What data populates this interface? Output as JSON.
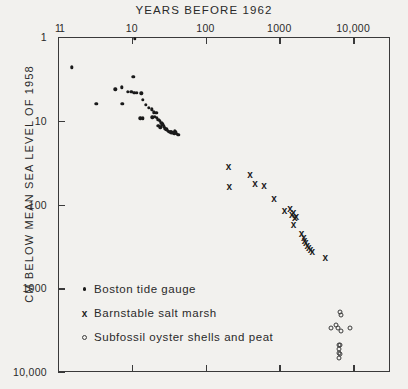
{
  "chart_data": {
    "type": "scatter",
    "title": "YEARS BEFORE 1962",
    "xlabel": "YEARS BEFORE 1962",
    "ylabel": "CM BELOW MEAN SEA LEVEL OF 1958",
    "xscale": "log",
    "yscale": "log",
    "xlim": [
      1,
      31623
    ],
    "ylim": [
      1,
      10000
    ],
    "y_inverted": true,
    "grid": false,
    "legend_position": "lower-left-inside",
    "xticks": [
      {
        "value": 1,
        "label": "1"
      },
      {
        "value": 10,
        "label": "10"
      },
      {
        "value": 100,
        "label": "100"
      },
      {
        "value": 1000,
        "label": "1000"
      },
      {
        "value": 10000,
        "label": "10,000"
      }
    ],
    "yticks": [
      {
        "value": 1,
        "label": "1"
      },
      {
        "value": 10,
        "label": "10"
      },
      {
        "value": 100,
        "label": "100"
      },
      {
        "value": 1000,
        "label": "1000"
      },
      {
        "value": 10000,
        "label": "10,000"
      }
    ],
    "series": [
      {
        "name": "Boston tide gauge",
        "marker": "dot",
        "points": [
          [
            1.55,
            2.3
          ],
          [
            11.0,
            1.05
          ],
          [
            10.5,
            3.0
          ],
          [
            3.3,
            6.3
          ],
          [
            7.4,
            6.3
          ],
          [
            6.0,
            4.2
          ],
          [
            7.3,
            4.0
          ],
          [
            8.8,
            4.5
          ],
          [
            9.8,
            4.5
          ],
          [
            10.8,
            4.6
          ],
          [
            11.6,
            4.6
          ],
          [
            13.5,
            4.7
          ],
          [
            14.0,
            5.6
          ],
          [
            15.5,
            6.4
          ],
          [
            17.0,
            7.0
          ],
          [
            18.6,
            7.3
          ],
          [
            20.0,
            7.9
          ],
          [
            21.5,
            8.1
          ],
          [
            13.0,
            9.3
          ],
          [
            14.2,
            9.3
          ],
          [
            19.0,
            9.1
          ],
          [
            20.5,
            9.0
          ],
          [
            21.8,
            9.2
          ],
          [
            22.8,
            9.7
          ],
          [
            24.0,
            10.0
          ],
          [
            25.0,
            10.6
          ],
          [
            23.0,
            11.4
          ],
          [
            24.5,
            12.0
          ],
          [
            26.0,
            11.0
          ],
          [
            27.0,
            11.6
          ],
          [
            28.2,
            12.3
          ],
          [
            29.5,
            12.7
          ],
          [
            30.5,
            13.2
          ],
          [
            31.5,
            13.5
          ],
          [
            32.5,
            13.6
          ],
          [
            33.5,
            13.7
          ],
          [
            34.5,
            13.8
          ],
          [
            35.5,
            13.9
          ],
          [
            36.5,
            14.0
          ],
          [
            37.5,
            14.1
          ],
          [
            38.5,
            13.4
          ],
          [
            39.5,
            13.6
          ],
          [
            41.0,
            14.3
          ],
          [
            42.5,
            14.6
          ]
        ]
      },
      {
        "name": "Barnstable salt marsh",
        "marker": "cross",
        "points": [
          [
            205,
            36
          ],
          [
            210,
            62
          ],
          [
            400,
            44
          ],
          [
            470,
            57
          ],
          [
            620,
            60
          ],
          [
            850,
            86
          ],
          [
            1180,
            118
          ],
          [
            1400,
            112
          ],
          [
            1480,
            132
          ],
          [
            1560,
            128
          ],
          [
            1620,
            145
          ],
          [
            1700,
            140
          ],
          [
            1560,
            175
          ],
          [
            2000,
            225
          ],
          [
            2150,
            250
          ],
          [
            2200,
            270
          ],
          [
            2280,
            290
          ],
          [
            2400,
            310
          ],
          [
            2500,
            330
          ],
          [
            2650,
            350
          ],
          [
            2800,
            370
          ],
          [
            4200,
            430
          ]
        ]
      },
      {
        "name": "Subfossil oyster shells and peat",
        "marker": "circle",
        "points": [
          [
            6700,
            1900
          ],
          [
            6900,
            2100
          ],
          [
            5000,
            3000
          ],
          [
            5900,
            2750
          ],
          [
            6300,
            3000
          ],
          [
            6800,
            3200
          ],
          [
            9200,
            2950
          ],
          [
            6400,
            4700
          ],
          [
            6600,
            4800
          ],
          [
            6500,
            5300
          ],
          [
            6350,
            5900
          ],
          [
            6550,
            6100
          ],
          [
            6500,
            6800
          ]
        ]
      }
    ]
  },
  "legend": {
    "items": [
      {
        "label": "Boston tide gauge",
        "marker": "dot"
      },
      {
        "label": "Barnstable salt marsh",
        "marker": "cross"
      },
      {
        "label": "Subfossil oyster shells and peat",
        "marker": "circle"
      }
    ]
  }
}
